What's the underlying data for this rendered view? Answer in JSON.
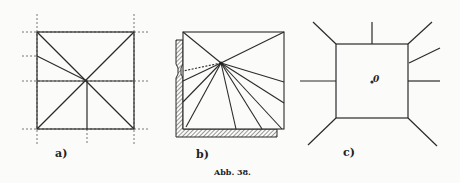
{
  "figure": {
    "caption": "Abb. 38.",
    "panels": [
      {
        "id": "a",
        "label": "a)"
      },
      {
        "id": "b",
        "label": "b)"
      },
      {
        "id": "c",
        "label": "c)",
        "point_label": "0"
      }
    ]
  },
  "colors": {
    "ink": "#2a2a2a",
    "paper": "#fbfbf9",
    "guide": "#555555"
  }
}
